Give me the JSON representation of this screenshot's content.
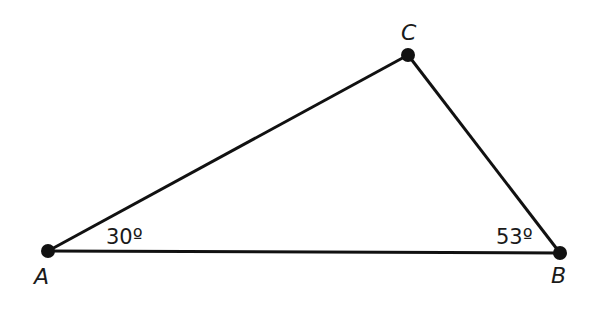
{
  "diagram": {
    "type": "triangle",
    "stroke_color": "#111111",
    "background": "#ffffff",
    "vertices": [
      {
        "id": "A",
        "label": "A",
        "x": 48,
        "y": 251
      },
      {
        "id": "B",
        "label": "B",
        "x": 560,
        "y": 253
      },
      {
        "id": "C",
        "label": "C",
        "x": 408,
        "y": 55
      }
    ],
    "angles": [
      {
        "vertex": "A",
        "label": "30º"
      },
      {
        "vertex": "B",
        "label": "53º"
      }
    ]
  }
}
